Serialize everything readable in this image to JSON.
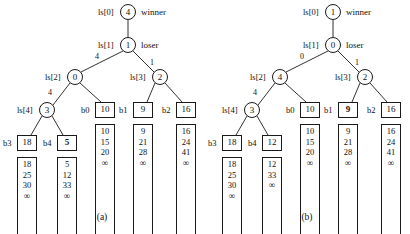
{
  "figures": [
    {
      "id": "a",
      "caption": "(a)",
      "nodes": [
        {
          "name": "ls0",
          "label": "ls[0]",
          "value": "4",
          "annotation": "winner"
        },
        {
          "name": "ls1",
          "label": "ls[1]",
          "value": "1",
          "annotation": "loser"
        },
        {
          "name": "ls2",
          "label": "ls[2]",
          "value": "0",
          "annotation": ""
        },
        {
          "name": "ls3",
          "label": "ls[3]",
          "value": "2",
          "annotation": ""
        },
        {
          "name": "ls4",
          "label": "ls[4]",
          "value": "3",
          "annotation": ""
        }
      ],
      "edge_labels": [
        {
          "name": "edge-ls1-left",
          "text": "4"
        },
        {
          "name": "edge-ls1-right",
          "text": "1"
        },
        {
          "name": "edge-ls2-left",
          "text": "4"
        }
      ],
      "leaves": [
        {
          "name": "b0",
          "label": "b0",
          "value": "10",
          "bold": false
        },
        {
          "name": "b1",
          "label": "b1",
          "value": "9",
          "bold": false
        },
        {
          "name": "b2",
          "label": "b2",
          "value": "16",
          "bold": false
        },
        {
          "name": "b3",
          "label": "b3",
          "value": "18",
          "bold": false
        },
        {
          "name": "b4",
          "label": "b4",
          "value": "5",
          "bold": true
        }
      ],
      "buffers": [
        {
          "name": "buffer-b0",
          "items": [
            "10",
            "15",
            "20",
            "∞"
          ]
        },
        {
          "name": "buffer-b1",
          "items": [
            "9",
            "21",
            "28",
            "∞"
          ]
        },
        {
          "name": "buffer-b2",
          "items": [
            "16",
            "24",
            "41",
            "∞"
          ]
        },
        {
          "name": "buffer-b3",
          "items": [
            "18",
            "25",
            "30",
            "∞"
          ]
        },
        {
          "name": "buffer-b4",
          "items": [
            "5",
            "12",
            "33",
            "∞"
          ]
        }
      ]
    },
    {
      "id": "b",
      "caption": "(b)",
      "nodes": [
        {
          "name": "ls0",
          "label": "ls[0]",
          "value": "1",
          "annotation": "winner"
        },
        {
          "name": "ls1",
          "label": "ls[1]",
          "value": "0",
          "annotation": "loser"
        },
        {
          "name": "ls2",
          "label": "ls[2]",
          "value": "4",
          "annotation": ""
        },
        {
          "name": "ls3",
          "label": "ls[3]",
          "value": "2",
          "annotation": ""
        },
        {
          "name": "ls4",
          "label": "ls[4]",
          "value": "3",
          "annotation": ""
        }
      ],
      "edge_labels": [
        {
          "name": "edge-ls1-left",
          "text": "0"
        },
        {
          "name": "edge-ls1-right",
          "text": "1"
        },
        {
          "name": "edge-ls2-left",
          "text": "4"
        }
      ],
      "leaves": [
        {
          "name": "b0",
          "label": "b0",
          "value": "10",
          "bold": false
        },
        {
          "name": "b1",
          "label": "b1",
          "value": "9",
          "bold": true
        },
        {
          "name": "b2",
          "label": "b2",
          "value": "16",
          "bold": false
        },
        {
          "name": "b3",
          "label": "b3",
          "value": "18",
          "bold": false
        },
        {
          "name": "b4",
          "label": "b4",
          "value": "12",
          "bold": false
        }
      ],
      "buffers": [
        {
          "name": "buffer-b0",
          "items": [
            "10",
            "15",
            "20",
            "∞"
          ]
        },
        {
          "name": "buffer-b1",
          "items": [
            "9",
            "21",
            "28",
            "∞"
          ]
        },
        {
          "name": "buffer-b2",
          "items": [
            "16",
            "24",
            "41",
            "∞"
          ]
        },
        {
          "name": "buffer-b3",
          "items": [
            "18",
            "25",
            "30",
            "∞"
          ]
        },
        {
          "name": "buffer-b4",
          "items": [
            "12",
            "33",
            "∞"
          ]
        }
      ]
    }
  ],
  "colors": {
    "stroke": "#1a1a1a",
    "background": "#ffffff"
  }
}
